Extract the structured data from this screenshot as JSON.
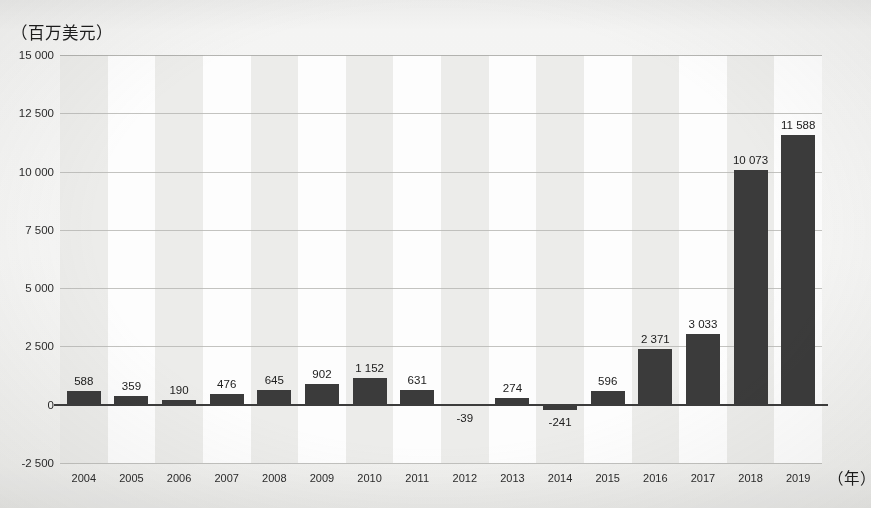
{
  "chart_data": {
    "type": "bar",
    "title": "",
    "ylabel": "（百万美元）",
    "xlabel": "（年）",
    "categories": [
      "2004",
      "2005",
      "2006",
      "2007",
      "2008",
      "2009",
      "2010",
      "2011",
      "2012",
      "2013",
      "2014",
      "2015",
      "2016",
      "2017",
      "2018",
      "2019"
    ],
    "values": [
      588,
      359,
      190,
      476,
      645,
      902,
      1152,
      631,
      -39,
      274,
      -241,
      596,
      2371,
      3033,
      10073,
      11588
    ],
    "value_labels": [
      "588",
      "359",
      "190",
      "476",
      "645",
      "902",
      "1 152",
      "631",
      "-39",
      "274",
      "-241",
      "596",
      "2 371",
      "3 033",
      "10 073",
      "11 588"
    ],
    "ylim": [
      -2500,
      15000
    ],
    "ytick_values": [
      15000,
      12500,
      10000,
      7500,
      5000,
      2500,
      0,
      -2500
    ],
    "ytick_labels": [
      "15 000",
      "12 500",
      "10 000",
      "7 500",
      "5 000",
      "2 500",
      "0",
      "-2 500"
    ],
    "grid": true,
    "legend": "none",
    "series_color": "#3b3b3b",
    "band_shade_color": "#ececea",
    "band_plain_color": "#fdfdfd",
    "gridline_color": "#b9b9b5",
    "zero_line_color": "#3c3c3c"
  }
}
